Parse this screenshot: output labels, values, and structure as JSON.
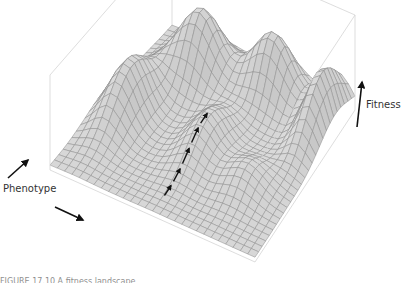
{
  "figure": {
    "type": "fitness-landscape-3d-surface",
    "axis_labels": {
      "phenotype": "Phenotype",
      "fitness": "Fitness"
    },
    "caption": "FIGURE 17.10 A fitness landscape",
    "colors": {
      "surface_fill": "#d9d9d9",
      "surface_shade": "#bdbdbd",
      "mesh_line": "#8a8a8a",
      "box_line": "#d4d4d4",
      "arrow": "#111111",
      "text": "#333333"
    },
    "peaks": [
      {
        "name": "front-left-peak"
      },
      {
        "name": "back-left-peak"
      },
      {
        "name": "back-right-peak"
      },
      {
        "name": "right-edge-peak"
      }
    ],
    "path_arrows_count": 5
  }
}
